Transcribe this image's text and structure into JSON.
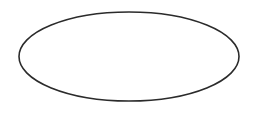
{
  "canvas": {
    "width": 256,
    "height": 114,
    "background_color": "#ffffff",
    "title": "Ellipse Outline"
  },
  "figure": {
    "type": "ellipse",
    "name": "oval-outline",
    "center_x": 129,
    "center_y": 56.5,
    "radius_x": 110,
    "radius_y": 44.5,
    "bounds": {
      "left": 19,
      "top": 12,
      "right": 239,
      "bottom": 101
    },
    "stroke_color": "#2b2b2b",
    "stroke_width": 1.6,
    "fill_color": "none",
    "label": ""
  }
}
